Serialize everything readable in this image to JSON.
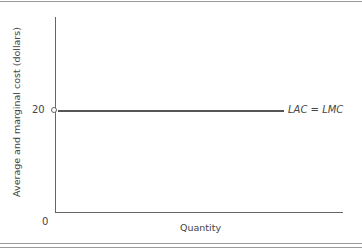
{
  "chart_data": {
    "type": "line",
    "title": "",
    "xlabel": "Quantity",
    "ylabel": "Average and marginal cost (dollars)",
    "y_ticks": [
      "0",
      "20"
    ],
    "x_ticks": [],
    "series": [
      {
        "name": "LAC = LMC",
        "description": "Horizontal long-run average cost equals long-run marginal cost",
        "x": [
          0,
          1
        ],
        "values": [
          20,
          20
        ],
        "start_marker": "open-circle"
      }
    ],
    "ylim": [
      0,
      40
    ],
    "grid": false,
    "legend_position": "inline-right"
  },
  "labels": {
    "tick_20": "20",
    "tick_0": "0",
    "series_label": "LAC = LMC",
    "x_axis_label": "Quantity",
    "y_axis_label": "Average and marginal cost (dollars)"
  }
}
